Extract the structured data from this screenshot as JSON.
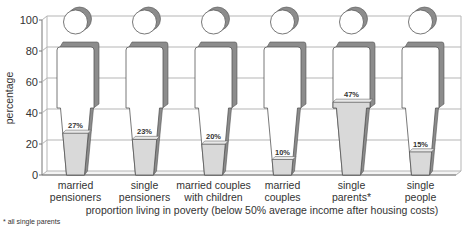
{
  "chart_data": {
    "type": "bar",
    "style": "pictogram-3d-person",
    "categories": [
      [
        "married",
        "pensioners"
      ],
      [
        "single",
        "pensioners"
      ],
      [
        "married couples",
        "with children"
      ],
      [
        "married",
        "couples"
      ],
      [
        "single",
        "parents*"
      ],
      [
        "single",
        "people"
      ]
    ],
    "values": [
      27,
      23,
      20,
      10,
      47,
      15
    ],
    "value_labels": [
      "27%",
      "23%",
      "20%",
      "10%",
      "47%",
      "15%"
    ],
    "title": "",
    "xlabel": "proportion living in poverty (below 50% average income after housing costs)",
    "ylabel": "percentage",
    "ylim": [
      0,
      100
    ],
    "yticks": [
      0,
      20,
      40,
      60,
      80,
      100
    ],
    "grid": true,
    "legend": "none",
    "colors": {
      "fill": "#d9d9d9",
      "shadow": "#8c8c8c",
      "outline": "#555555",
      "grid": "#b5b5b5"
    }
  },
  "footnote": "* all single parents"
}
